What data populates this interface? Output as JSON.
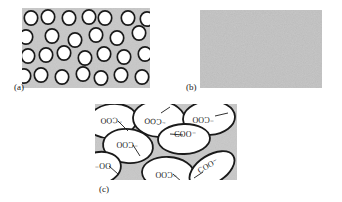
{
  "figure": {
    "background_color": "#ffffff",
    "gray_fill": "#c8c8c8",
    "gray_fill_b": "#c2c2c2",
    "outline_color": "#1a1a1a",
    "droplet_fill": "#ffffff"
  },
  "panels": [
    {
      "id": "a",
      "label": "(a)",
      "label_x": 14,
      "label_y": 90,
      "rect": {
        "x": 22,
        "y": 8,
        "w": 128,
        "h": 80
      },
      "description": "gray field containing many small white circles with dark outlines",
      "circle_radius": 7.2,
      "circles": [
        {
          "cx": 31,
          "cy": 18
        },
        {
          "cx": 48,
          "cy": 17
        },
        {
          "cx": 69,
          "cy": 18
        },
        {
          "cx": 89,
          "cy": 17
        },
        {
          "cx": 105,
          "cy": 18
        },
        {
          "cx": 128,
          "cy": 18
        },
        {
          "cx": 147,
          "cy": 19
        },
        {
          "cx": 26,
          "cy": 37
        },
        {
          "cx": 52,
          "cy": 36
        },
        {
          "cx": 75,
          "cy": 40
        },
        {
          "cx": 96,
          "cy": 35
        },
        {
          "cx": 117,
          "cy": 38
        },
        {
          "cx": 139,
          "cy": 33
        },
        {
          "cx": 28,
          "cy": 56
        },
        {
          "cx": 46,
          "cy": 55
        },
        {
          "cx": 64,
          "cy": 53
        },
        {
          "cx": 85,
          "cy": 58
        },
        {
          "cx": 104,
          "cy": 54
        },
        {
          "cx": 124,
          "cy": 57
        },
        {
          "cx": 145,
          "cy": 54
        },
        {
          "cx": 24,
          "cy": 76
        },
        {
          "cx": 41,
          "cy": 75
        },
        {
          "cx": 62,
          "cy": 77
        },
        {
          "cx": 83,
          "cy": 74
        },
        {
          "cx": 101,
          "cy": 78
        },
        {
          "cx": 121,
          "cy": 75
        },
        {
          "cx": 142,
          "cy": 77
        }
      ]
    },
    {
      "id": "b",
      "label": "(b)",
      "label_x": 186,
      "label_y": 90,
      "rect": {
        "x": 200,
        "y": 10,
        "w": 122,
        "h": 78
      },
      "description": "uniform gray field with faint noise texture, no droplets"
    },
    {
      "id": "c",
      "label": "(c)",
      "label_x": 99,
      "label_y": 192,
      "rect": {
        "x": 95,
        "y": 104,
        "w": 142,
        "h": 76
      },
      "description": "gray field packed with large white ellipses each annotated with a carboxylate group label"
    }
  ],
  "annotations": {
    "group_label": "⁻COO",
    "group_label_rev": "COO⁻",
    "items": [
      {
        "text": "⁻COO",
        "x": 111,
        "y": 118,
        "rotate": 178,
        "leader": {
          "x1": 118,
          "y1": 121,
          "x2": 128,
          "y2": 131
        }
      },
      {
        "text": "⁻COO",
        "x": 155,
        "y": 119,
        "rotate": 182,
        "leader": {
          "x1": 161,
          "y1": 113,
          "x2": 170,
          "y2": 107
        }
      },
      {
        "text": "⁻COO",
        "x": 203,
        "y": 117,
        "rotate": 180,
        "leader": {
          "x1": 215,
          "y1": 116,
          "x2": 228,
          "y2": 113
        }
      },
      {
        "text": "⁻COO",
        "x": 127,
        "y": 142,
        "rotate": 180,
        "leader": {
          "x1": 133,
          "y1": 145,
          "x2": 140,
          "y2": 156
        }
      },
      {
        "text": "COO⁻",
        "x": 185,
        "y": 137,
        "rotate": 0,
        "leader": {
          "x1": 183,
          "y1": 135,
          "x2": 170,
          "y2": 134
        }
      },
      {
        "text": "⁻COO",
        "x": 166,
        "y": 172,
        "rotate": 180,
        "leader": {
          "x1": 173,
          "y1": 174,
          "x2": 182,
          "y2": 182
        }
      },
      {
        "text": "COO⁻",
        "x": 209,
        "y": 168,
        "rotate": -30,
        "leader": {
          "x1": 203,
          "y1": 172,
          "x2": 194,
          "y2": 178
        }
      },
      {
        "text": "OO⁻",
        "x": 103,
        "y": 163,
        "rotate": 180,
        "leader": {
          "x1": 109,
          "y1": 166,
          "x2": 118,
          "y2": 174
        }
      }
    ]
  },
  "ellipses_c": [
    {
      "cx": 112,
      "cy": 121,
      "rx": 25,
      "ry": 17,
      "rot": -8
    },
    {
      "cx": 159,
      "cy": 119,
      "rx": 26,
      "ry": 18,
      "rot": 4
    },
    {
      "cx": 209,
      "cy": 118,
      "rx": 26,
      "ry": 17,
      "rot": -4
    },
    {
      "cx": 128,
      "cy": 146,
      "rx": 25,
      "ry": 17,
      "rot": 6
    },
    {
      "cx": 184,
      "cy": 139,
      "rx": 26,
      "ry": 15,
      "rot": -2
    },
    {
      "cx": 168,
      "cy": 173,
      "rx": 26,
      "ry": 16,
      "rot": 3
    },
    {
      "cx": 212,
      "cy": 169,
      "rx": 25,
      "ry": 14,
      "rot": -32
    },
    {
      "cx": 99,
      "cy": 168,
      "rx": 22,
      "ry": 16,
      "rot": -10
    }
  ]
}
